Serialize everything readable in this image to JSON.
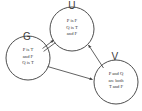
{
  "diagram": {
    "background_color": "#ffffff",
    "stroke_color": "#3a3a3a",
    "nodes": [
      {
        "id": "U",
        "label": "U",
        "cx": 72,
        "cy": 29,
        "r": 22,
        "lines": [
          "P is F",
          "Q is T",
          "and F"
        ],
        "line1": "P is F",
        "line2": "Q is T",
        "line3": "and F"
      },
      {
        "id": "G",
        "label": "G",
        "cx": 28,
        "cy": 58,
        "r": 22,
        "lines": [
          "P is T",
          "and F",
          "Q is T"
        ],
        "line1": "P is T",
        "line2": "and F",
        "line3": "Q is T"
      },
      {
        "id": "V",
        "label": "V",
        "cx": 116,
        "cy": 82,
        "r": 22,
        "lines": [
          "P and Q",
          "are both",
          "T and F"
        ],
        "line1": "P and Q",
        "line2": "are both",
        "line3": "T and F"
      }
    ],
    "edges": [
      {
        "id": "g-to-u",
        "from": "G",
        "to": "U",
        "style": "double-line-arrow"
      },
      {
        "id": "g-to-v",
        "from": "G",
        "to": "V",
        "style": "single-line-arrow"
      },
      {
        "id": "v-to-u",
        "from": "V",
        "to": "U",
        "style": "single-line-arrow"
      }
    ]
  }
}
